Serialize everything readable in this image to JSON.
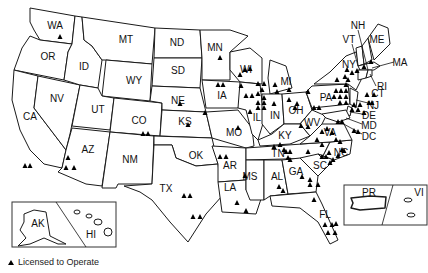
{
  "legend": {
    "marker": "triangle-icon",
    "label": "Licensed to Operate"
  },
  "colors": {
    "stroke": "#1a1a1a",
    "marker": "#000000",
    "background": "#ffffff"
  },
  "states": [
    {
      "id": "WA",
      "label": "WA",
      "x": 55,
      "y": 26,
      "d": "M30,8 L75,16 L72,44 L40,40 L34,30 L30,22 Z"
    },
    {
      "id": "OR",
      "label": "OR",
      "x": 48,
      "y": 57,
      "d": "M40,40 L72,44 L68,52 L64,80 L14,70 L22,48 L30,36 Z"
    },
    {
      "id": "CA",
      "label": "CA",
      "x": 30,
      "y": 117,
      "d": "M14,70 L38,76 L34,108 L66,150 L62,168 L44,164 L30,150 L20,130 L12,100 Z"
    },
    {
      "id": "NV",
      "label": "NV",
      "x": 57,
      "y": 99,
      "d": "M38,76 L80,85 L70,134 L66,150 L34,108 Z"
    },
    {
      "id": "ID",
      "label": "ID",
      "x": 84,
      "y": 67,
      "d": "M75,16 L82,17 L84,40 L92,46 L102,60 L98,88 L80,85 L64,80 L68,52 L72,44 Z"
    },
    {
      "id": "MT",
      "label": "MT",
      "x": 126,
      "y": 40,
      "d": "M82,17 L155,28 L152,64 L106,60 L102,60 L92,46 L84,40 Z"
    },
    {
      "id": "WY",
      "label": "WY",
      "x": 134,
      "y": 81,
      "d": "M106,60 L152,64 L150,101 L102,96 Z"
    },
    {
      "id": "UT",
      "label": "UT",
      "x": 98,
      "y": 110,
      "d": "M80,85 L98,88 L102,96 L114,98 L110,130 L72,126 Z"
    },
    {
      "id": "CO",
      "label": "CO",
      "x": 139,
      "y": 121,
      "d": "M114,98 L162,103 L160,136 L110,132 Z"
    },
    {
      "id": "AZ",
      "label": "AZ",
      "x": 88,
      "y": 150,
      "d": "M72,128 L110,132 L102,186 L86,184 L58,172 L62,168 L66,150 Z"
    },
    {
      "id": "NM",
      "label": "NM",
      "x": 130,
      "y": 160,
      "d": "M110,132 L154,136 L152,184 L118,184 L116,188 L102,188 Z"
    },
    {
      "id": "ND",
      "label": "ND",
      "x": 177,
      "y": 43,
      "d": "M155,28 L200,30 L202,58 L154,58 Z"
    },
    {
      "id": "SD",
      "label": "SD",
      "x": 178,
      "y": 71,
      "d": "M154,58 L202,58 L200,88 L152,86 Z"
    },
    {
      "id": "NE",
      "label": "NE",
      "x": 178,
      "y": 101,
      "d": "M152,86 L200,88 L206,112 L162,110 L162,103 L150,101 Z"
    },
    {
      "id": "KS",
      "label": "KS",
      "x": 185,
      "y": 122,
      "d": "M162,110 L206,112 L212,138 L160,136 Z"
    },
    {
      "id": "OK",
      "label": "OK",
      "x": 196,
      "y": 156,
      "d": "M154,136 L212,138 L218,164 L196,166 L176,158 L172,145 L154,145 Z"
    },
    {
      "id": "TX",
      "label": "TX",
      "x": 166,
      "y": 189,
      "d": "M154,145 L172,145 L176,158 L196,166 L218,164 L222,196 L206,214 L188,242 L170,222 L152,200 L140,192 L124,186 L152,184 Z"
    },
    {
      "id": "MN",
      "label": "MN",
      "x": 215,
      "y": 48,
      "d": "M200,30 L230,30 L248,36 L230,52 L230,80 L202,80 L202,58 Z"
    },
    {
      "id": "IA",
      "label": "IA",
      "x": 222,
      "y": 96,
      "d": "M202,80 L240,82 L246,92 L238,108 L206,108 Z"
    },
    {
      "id": "MO",
      "label": "MO",
      "x": 234,
      "y": 133,
      "d": "M206,112 L238,110 L252,128 L254,146 L246,148 L212,138 Z"
    },
    {
      "id": "AR",
      "label": "AR",
      "x": 230,
      "y": 166,
      "d": "M212,146 L246,148 L246,180 L218,182 L218,164 Z"
    },
    {
      "id": "LA",
      "label": "LA",
      "x": 230,
      "y": 188,
      "d": "M218,182 L246,180 L246,190 L262,196 L256,214 L222,212 Z"
    },
    {
      "id": "WI",
      "label": "WI",
      "x": 246,
      "y": 70,
      "d": "M230,52 L250,48 L262,58 L262,84 L240,82 L230,70 Z"
    },
    {
      "id": "IL",
      "label": "IL",
      "x": 257,
      "y": 118,
      "d": "M240,82 L260,84 L264,120 L258,140 L252,134 L246,110 L238,108 Z"
    },
    {
      "id": "MI",
      "label": "MI",
      "x": 286,
      "y": 82,
      "d": "M270,60 L286,66 L292,88 L270,94 L268,78 Z"
    },
    {
      "id": "IN",
      "label": "IN",
      "x": 275,
      "y": 116,
      "d": "M262,94 L282,94 L284,124 L270,134 L262,124 Z"
    },
    {
      "id": "OH",
      "label": "OH",
      "x": 296,
      "y": 111,
      "d": "M282,94 L306,92 L312,110 L300,124 L284,124 Z"
    },
    {
      "id": "KY",
      "label": "KY",
      "x": 285,
      "y": 136,
      "d": "M258,140 L272,134 L284,124 L300,124 L310,136 L290,144 L260,146 Z"
    },
    {
      "id": "TN",
      "label": "TN",
      "x": 278,
      "y": 154,
      "d": "M246,148 L330,142 L322,158 L246,160 Z"
    },
    {
      "id": "MS",
      "label": "MS",
      "x": 250,
      "y": 177,
      "d": "M246,160 L264,160 L264,200 L250,200 L246,190 Z"
    },
    {
      "id": "AL",
      "label": "AL",
      "x": 277,
      "y": 177,
      "d": "M264,160 L282,160 L288,194 L270,196 L264,200 Z"
    },
    {
      "id": "GA",
      "label": "GA",
      "x": 296,
      "y": 172,
      "d": "M282,160 L300,158 L318,176 L316,192 L288,194 Z"
    },
    {
      "id": "FL",
      "label": "FL",
      "x": 325,
      "y": 215,
      "d": "M270,196 L316,192 L322,204 L338,240 L330,244 L318,222 L300,208 L272,206 Z"
    },
    {
      "id": "SC",
      "label": "SC",
      "x": 320,
      "y": 166,
      "d": "M300,158 L318,154 L334,160 L318,176 Z"
    },
    {
      "id": "NC",
      "label": "NC",
      "x": 341,
      "y": 153,
      "d": "M322,158 L330,142 L352,140 L350,154 L334,160 L318,154 Z"
    },
    {
      "id": "VA",
      "label": "VA",
      "x": 330,
      "y": 133,
      "d": "M310,136 L322,124 L344,124 L352,140 L330,142 L300,144 Z"
    },
    {
      "id": "WV",
      "label": "WV",
      "x": 312,
      "y": 123,
      "d": "M300,124 L312,110 L326,116 L322,124 L310,136 Z"
    },
    {
      "id": "PA",
      "label": "PA",
      "x": 326,
      "y": 98,
      "d": "M306,92 L312,86 L348,84 L350,104 L312,108 Z"
    },
    {
      "id": "NY",
      "label": "NY",
      "x": 349,
      "y": 65,
      "d": "M314,84 L330,72 L346,56 L356,52 L362,78 L356,90 L348,84 Z"
    },
    {
      "id": "VT",
      "label": "VT",
      "x": 349,
      "y": 40,
      "d": "M356,48 L362,46 L364,64 L358,66 Z"
    },
    {
      "id": "NH",
      "label": "NH",
      "x": 358,
      "y": 26,
      "d": "M362,46 L368,38 L372,60 L364,64 Z"
    },
    {
      "id": "ME",
      "label": "ME",
      "x": 377,
      "y": 40,
      "d": "M368,38 L378,24 L388,28 L390,44 L374,60 Z"
    },
    {
      "id": "MA",
      "label": "MA",
      "x": 400,
      "y": 63,
      "d": "M358,66 L374,62 L380,66 L374,70 L360,70 Z"
    },
    {
      "id": "CT",
      "label": "CT",
      "x": 378,
      "y": 94,
      "d": "M358,70 L368,70 L366,78 L358,80 Z"
    },
    {
      "id": "RI",
      "label": "RI",
      "x": 382,
      "y": 87,
      "d": "M368,70 L372,70 L372,76 L366,78 Z"
    },
    {
      "id": "NJ",
      "label": "NJ",
      "x": 373,
      "y": 106,
      "d": "M350,88 L358,92 L356,108 L350,104 Z"
    },
    {
      "id": "DE",
      "label": "DE",
      "x": 369,
      "y": 116,
      "d": "M348,106 L352,108 L350,116 L346,114 Z"
    },
    {
      "id": "MD",
      "label": "MD",
      "x": 369,
      "y": 126,
      "d": "M322,114 L346,110 L350,118 L338,122 L326,118 Z"
    },
    {
      "id": "DC",
      "label": "DC",
      "x": 369,
      "y": 137,
      "d": ""
    }
  ],
  "leaders": [
    {
      "from": [
        358,
        30
      ],
      "to": [
        368,
        70
      ]
    },
    {
      "from": [
        352,
        44
      ],
      "to": [
        358,
        66
      ]
    },
    {
      "from": [
        394,
        62
      ],
      "to": [
        372,
        68
      ]
    },
    {
      "from": [
        376,
        86
      ],
      "to": [
        370,
        74
      ]
    },
    {
      "from": [
        368,
        103
      ],
      "to": [
        356,
        100
      ]
    },
    {
      "from": [
        362,
        114
      ],
      "to": [
        350,
        112
      ]
    },
    {
      "from": [
        362,
        124
      ],
      "to": [
        346,
        118
      ]
    },
    {
      "from": [
        362,
        134
      ],
      "to": [
        340,
        122
      ]
    }
  ],
  "insets": {
    "ak_hi": {
      "x": 12,
      "y": 202,
      "w": 104,
      "h": 45,
      "labels": [
        {
          "text": "AK",
          "x": 38,
          "y": 224
        },
        {
          "text": "HI",
          "x": 91,
          "y": 235
        }
      ]
    },
    "pr_vi": {
      "x": 344,
      "y": 185,
      "w": 83,
      "h": 40,
      "labels": [
        {
          "text": "PR",
          "x": 369,
          "y": 193
        },
        {
          "text": "VI",
          "x": 419,
          "y": 193
        }
      ]
    }
  },
  "markers": [
    [
      60,
      37
    ],
    [
      180,
      104
    ],
    [
      188,
      125
    ],
    [
      205,
      113
    ],
    [
      143,
      134
    ],
    [
      148,
      134
    ],
    [
      25,
      166
    ],
    [
      30,
      166
    ],
    [
      68,
      158
    ],
    [
      66,
      168
    ],
    [
      74,
      168
    ],
    [
      184,
      196
    ],
    [
      190,
      196
    ],
    [
      193,
      217
    ],
    [
      200,
      217
    ],
    [
      220,
      58
    ],
    [
      218,
      85
    ],
    [
      223,
      85
    ],
    [
      240,
      75
    ],
    [
      245,
      70
    ],
    [
      241,
      86
    ],
    [
      250,
      69
    ],
    [
      258,
      84
    ],
    [
      264,
      84
    ],
    [
      246,
      96
    ],
    [
      252,
      96
    ],
    [
      258,
      94
    ],
    [
      262,
      90
    ],
    [
      264,
      98
    ],
    [
      258,
      103
    ],
    [
      264,
      103
    ],
    [
      258,
      108
    ],
    [
      264,
      108
    ],
    [
      250,
      112
    ],
    [
      238,
      128
    ],
    [
      220,
      157
    ],
    [
      226,
      157
    ],
    [
      245,
      176
    ],
    [
      237,
      203
    ],
    [
      246,
      211
    ],
    [
      274,
      147
    ],
    [
      280,
      145
    ],
    [
      284,
      150
    ],
    [
      286,
      152
    ],
    [
      288,
      158
    ],
    [
      290,
      160
    ],
    [
      279,
      187
    ],
    [
      283,
      191
    ],
    [
      290,
      152
    ],
    [
      302,
      177
    ],
    [
      310,
      180
    ],
    [
      310,
      185
    ],
    [
      318,
      185
    ],
    [
      314,
      200
    ],
    [
      325,
      225
    ],
    [
      332,
      225
    ],
    [
      328,
      233
    ],
    [
      335,
      233
    ],
    [
      336,
      224
    ],
    [
      301,
      126
    ],
    [
      308,
      127
    ],
    [
      317,
      140
    ],
    [
      322,
      132
    ],
    [
      327,
      129
    ],
    [
      332,
      133
    ],
    [
      336,
      140
    ],
    [
      340,
      142
    ],
    [
      342,
      150
    ],
    [
      344,
      151
    ],
    [
      338,
      156
    ],
    [
      333,
      160
    ],
    [
      330,
      163
    ],
    [
      326,
      157
    ],
    [
      322,
      157
    ],
    [
      308,
      152
    ],
    [
      322,
      145
    ],
    [
      329,
      153
    ],
    [
      275,
      85
    ],
    [
      277,
      92
    ],
    [
      289,
      100
    ],
    [
      274,
      104
    ],
    [
      295,
      108
    ],
    [
      297,
      104
    ],
    [
      289,
      90
    ],
    [
      308,
      92
    ],
    [
      314,
      108
    ],
    [
      319,
      108
    ],
    [
      336,
      91
    ],
    [
      341,
      91
    ],
    [
      346,
      91
    ],
    [
      334,
      97
    ],
    [
      340,
      97
    ],
    [
      346,
      97
    ],
    [
      340,
      103
    ],
    [
      346,
      103
    ],
    [
      338,
      122
    ],
    [
      342,
      122
    ],
    [
      354,
      131
    ],
    [
      358,
      132
    ],
    [
      352,
      110
    ],
    [
      358,
      110
    ],
    [
      354,
      105
    ],
    [
      360,
      105
    ],
    [
      347,
      70
    ],
    [
      352,
      73
    ],
    [
      345,
      77
    ],
    [
      348,
      80
    ],
    [
      337,
      80
    ],
    [
      346,
      85
    ],
    [
      357,
      71
    ],
    [
      364,
      67
    ],
    [
      371,
      62
    ],
    [
      367,
      95
    ],
    [
      374,
      95
    ],
    [
      369,
      103
    ],
    [
      372,
      103
    ],
    [
      364,
      113
    ]
  ]
}
